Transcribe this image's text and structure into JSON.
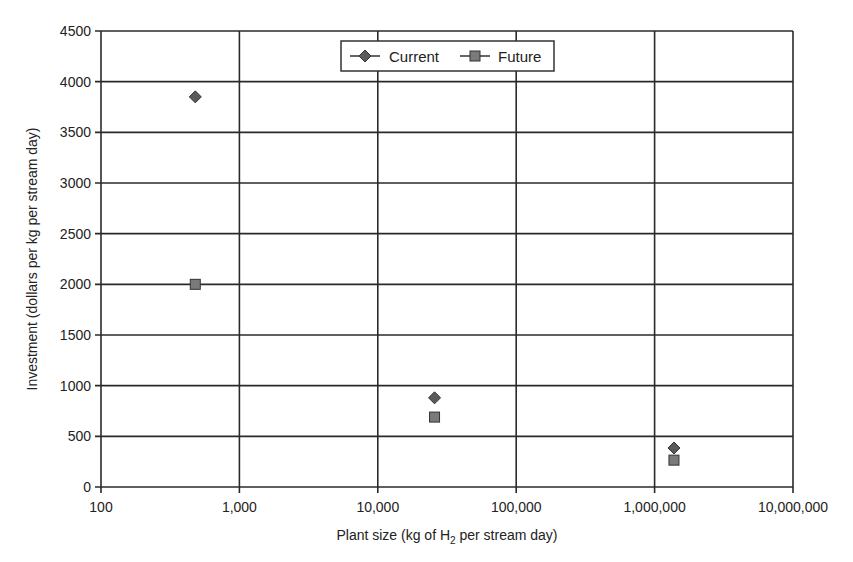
{
  "chart_data": {
    "type": "scatter",
    "title": "",
    "xlabel": "Plant size (kg of H2 per stream day)",
    "xlabel_parts": {
      "pre": "Plant size (kg of H",
      "sub": "2",
      "post": " per stream day)"
    },
    "ylabel": "Investment (dollars per kg per stream day)",
    "xscale": "log",
    "xlim": [
      100,
      10000000
    ],
    "ylim": [
      0,
      4500
    ],
    "x_ticks": [
      100,
      1000,
      10000,
      100000,
      1000000,
      10000000
    ],
    "x_tick_labels": [
      "100",
      "1,000",
      "10,000",
      "100,000",
      "1,000,000",
      "10,000,000"
    ],
    "y_ticks": [
      0,
      500,
      1000,
      1500,
      2000,
      2500,
      3000,
      3500,
      4000,
      4500
    ],
    "y_tick_labels": [
      "0",
      "500",
      "1000",
      "1500",
      "2000",
      "2500",
      "3000",
      "3500",
      "4000",
      "4500"
    ],
    "grid": true,
    "legend_position": "top-center-inside",
    "series": [
      {
        "name": "Current",
        "marker": "diamond",
        "color": "#5a5a5a",
        "x": [
          480,
          25700,
          1380000
        ],
        "y": [
          3850,
          880,
          385
        ]
      },
      {
        "name": "Future",
        "marker": "square",
        "color": "#7a7a7a",
        "x": [
          480,
          25700,
          1380000
        ],
        "y": [
          2000,
          690,
          265
        ]
      }
    ]
  },
  "legend": {
    "items": [
      {
        "label": "Current"
      },
      {
        "label": "Future"
      }
    ]
  }
}
